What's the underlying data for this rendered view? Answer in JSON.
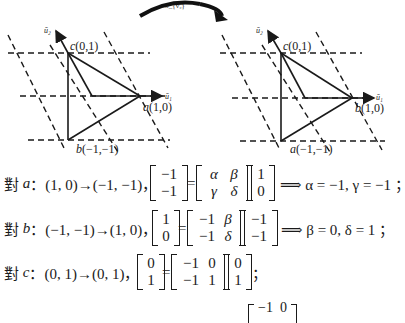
{
  "diagram": {
    "transform_label": "σ_{v₂}",
    "left": {
      "axis_u1": "ū₁",
      "axis_u2": "ū₂",
      "point_c": {
        "name": "c",
        "coord": "(0,1)"
      },
      "point_a": {
        "name": "a",
        "coord": "(1,0)"
      },
      "point_b": {
        "name": "b",
        "coord": "(−1,−1)"
      }
    },
    "right": {
      "axis_u1": "ū₁",
      "axis_u2": "ū₂",
      "point_c": {
        "name": "c",
        "coord": "(0,1)"
      },
      "point_b": {
        "name": "b",
        "coord": "(1,0)"
      },
      "point_a": {
        "name": "a",
        "coord": "(−1,−1)"
      }
    }
  },
  "equations": [
    {
      "prefix": "對",
      "var": "a",
      "mapping": "：(1, 0)→(−1, −1)，",
      "lhs": [
        "−1",
        "−1"
      ],
      "matrix": [
        [
          "α",
          "β"
        ],
        [
          "γ",
          "δ"
        ]
      ],
      "vec": [
        "1",
        "0"
      ],
      "result": "⟹ α = −1, γ = −1 ；"
    },
    {
      "prefix": "對",
      "var": "b",
      "mapping": "：(−1, −1)→(1, 0)，",
      "lhs": [
        "1",
        "0"
      ],
      "matrix": [
        [
          "−1",
          "β"
        ],
        [
          "−1",
          "δ"
        ]
      ],
      "vec": [
        "−1",
        "−1"
      ],
      "result": "⟹ β = 0, δ = 1 ；"
    },
    {
      "prefix": "對",
      "var": "c",
      "mapping": "：(0, 1)→(0, 1)，",
      "lhs": [
        "0",
        "1"
      ],
      "matrix": [
        [
          "−1",
          "0"
        ],
        [
          "−1",
          "1"
        ]
      ],
      "vec": [
        "0",
        "1"
      ],
      "result": "；"
    }
  ],
  "partial_bottom_matrix_row": "−1  0"
}
